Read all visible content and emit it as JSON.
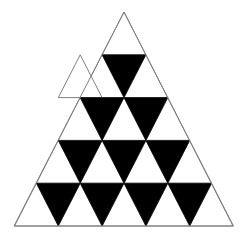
{
  "figure": {
    "background_color": "#FFFFFF",
    "outline_color": "#808080",
    "fill_color": "#000000",
    "white_color": "#FFFFFF",
    "outline_width": 1,
    "rows": 5,
    "apex": {
      "x": 124,
      "y": 12
    },
    "base_left": {
      "x": 14,
      "y": 226
    },
    "base_right": {
      "x": 233,
      "y": 226
    },
    "row_height": 42.8,
    "counts": {
      "total_small_triangles": 25,
      "upward_white": 15,
      "downward_black": 10,
      "black_per_row": [
        0,
        1,
        2,
        3,
        4
      ],
      "white_per_row": [
        1,
        2,
        3,
        4,
        5
      ]
    }
  },
  "chart_data": {
    "type": "bar",
    "xlabel": "Row",
    "ylabel": "Count of small triangles",
    "categories": [
      "Row 1",
      "Row 2",
      "Row 3",
      "Row 4",
      "Row 5"
    ],
    "series": [
      {
        "name": "Upward (white)",
        "values": [
          1,
          2,
          3,
          4,
          5
        ]
      },
      {
        "name": "Downward (black)",
        "values": [
          0,
          1,
          2,
          3,
          4
        ]
      }
    ],
    "ylim": [
      0,
      5
    ],
    "grid": false,
    "legend": "none",
    "annotations": [
      "Row 1 apex triangle is white",
      "Total black downward triangles: 10",
      "Total white upward triangles: 15"
    ]
  },
  "geometry": {
    "outer_triangle": "124,12 233,226 14,226",
    "white_triangles": [
      "124,12 145.9,54.8 102.1,54.8",
      "102.1,54.8 124,97.6 80.2,97.6",
      "145.9,54.8 167.8,97.6 124,97.6",
      "80.2,54.8 102.1,97.6 58.3,97.6",
      "80.2,97.6 102.1,140.4 58.3,140.4",
      "124,97.6 145.9,140.4 102.1,140.4",
      "167.8,97.6 189.7,140.4 145.9,140.4",
      "58.3,140.4 80.2,183.2 36.4,183.2",
      "102.1,140.4 124,183.2 80.2,183.2",
      "145.9,140.4 167.8,183.2 124,183.2",
      "189.7,140.4 211.6,183.2 167.8,183.2",
      "36.4,183.2 58.3,226 14.5,226",
      "80.2,183.2 102.1,226 58.3,226",
      "124,183.2 145.9,226 102.1,226",
      "167.8,183.2 189.7,226 145.9,226",
      "211.6,183.2 233.5,226 189.7,226"
    ],
    "black_triangles": [
      "102.1,54.8 145.9,54.8 124,97.6",
      "80.2,97.6 124,97.6 102.1,140.4",
      "124,97.6 167.8,97.6 145.9,140.4",
      "58.3,140.4 102.1,140.4 80.2,183.2",
      "102.1,140.4 145.9,140.4 124,183.2",
      "145.9,140.4 189.7,140.4 167.8,183.2",
      "36.4,183.2 80.2,183.2 58.3,226",
      "80.2,183.2 124,183.2 102.1,226",
      "124,183.2 167.8,183.2 145.9,226",
      "167.8,183.2 211.6,183.2 189.7,226"
    ]
  }
}
